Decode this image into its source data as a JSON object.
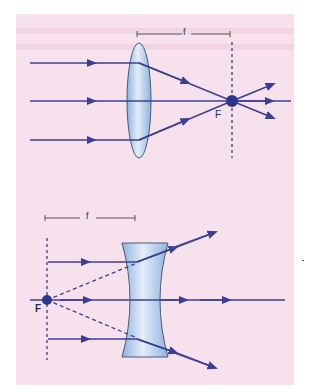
{
  "figure": {
    "background_color": "#f7e1ec",
    "ray_color": "#3c3f98",
    "lens_fill": "#b9d3ee",
    "lens_stroke": "#4a5a7a",
    "focal_point_color": "#2c3590"
  },
  "converging_lens": {
    "focal_label": "f",
    "focus_label": "F",
    "focal_bar": {
      "x1": 137,
      "x2": 230,
      "y": 34
    },
    "lens": {
      "cx": 139,
      "top": 43,
      "bottom": 158,
      "half_width": 12
    },
    "focus": {
      "x": 232,
      "y": 101
    },
    "focal_plane": {
      "x": 232,
      "y1": 42,
      "y2": 158
    },
    "rays_in_y": [
      63,
      101,
      140
    ],
    "ray_start_x": 30,
    "axis_end_x": 291
  },
  "diverging_lens": {
    "focal_label": "f",
    "focus_label": "F",
    "focal_bar": {
      "x1": 45,
      "x2": 135,
      "y": 218
    },
    "lens": {
      "cx": 145,
      "top": 243,
      "bottom": 357,
      "half_width_edge": 23,
      "half_width_center": 8
    },
    "focus": {
      "x": 47,
      "y": 300
    },
    "focal_plane": {
      "x": 47,
      "y1": 238,
      "y2": 360
    },
    "rays_in_y": [
      262,
      300,
      339
    ],
    "ray_start_x": 48,
    "axis_start_x": 30,
    "axis_end_x": 285
  }
}
